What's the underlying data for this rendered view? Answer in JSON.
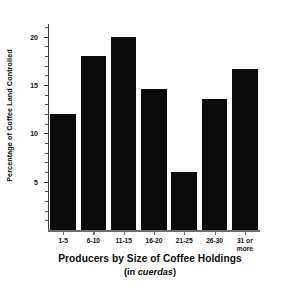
{
  "chart_data": {
    "type": "bar",
    "title": "",
    "categories": [
      "1-5",
      "6-10",
      "11-15",
      "16-20",
      "21-25",
      "26-30",
      "31 or\nmore"
    ],
    "values": [
      12.0,
      18.0,
      20.0,
      14.6,
      6.0,
      13.5,
      16.6
    ],
    "xlabel": "Producers by Size of Coffee Holdings",
    "xlabel_sub_prefix": "(in ",
    "xlabel_sub_em": "cuerdas",
    "xlabel_sub_suffix": ")",
    "ylabel": "Percentage of Coffee Land Controlled",
    "ylim": [
      0,
      21.3
    ],
    "ytick_labels": [
      "5",
      "10",
      "15",
      "20"
    ],
    "ytick_values": [
      5,
      10,
      15,
      20
    ],
    "yminor_step": 1,
    "grid": false,
    "legend": "none",
    "bar_color": "#0b0b0b",
    "axis_color": "#3a3a3a",
    "baseline_color": "#6d6d6d",
    "background": "#ffffff"
  }
}
